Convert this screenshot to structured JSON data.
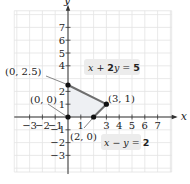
{
  "figure": {
    "origin_px": [
      68,
      117
    ],
    "unit_px": 12.8,
    "grid": {
      "x_min": -4.2,
      "x_max": 8.1,
      "y_min": -4.3,
      "y_max": 8.3,
      "step": 1
    },
    "colors": {
      "grid": "#e3e3e3",
      "axis": "#333333",
      "boundary": "#6e6e6e",
      "region_fill": "#eef0f3",
      "label_bg": "#ececec",
      "point": "#111111"
    }
  },
  "axes": {
    "x_label": "x",
    "y_label": "y",
    "x_ticks": [
      {
        "value": -3,
        "label": "−3"
      },
      {
        "value": -2,
        "label": "−2"
      },
      {
        "value": -1,
        "label": "−1"
      },
      {
        "value": 1,
        "label": "1"
      },
      {
        "value": 3,
        "label": "3"
      },
      {
        "value": 4,
        "label": "4"
      },
      {
        "value": 5,
        "label": "5"
      },
      {
        "value": 6,
        "label": "6"
      },
      {
        "value": 7,
        "label": "7"
      }
    ],
    "y_ticks": [
      {
        "value": 7,
        "label": "7"
      },
      {
        "value": 6,
        "label": "6"
      },
      {
        "value": 5,
        "label": "5"
      },
      {
        "value": 4,
        "label": "4"
      },
      {
        "value": 2,
        "label": "2"
      },
      {
        "value": 1,
        "label": "1"
      },
      {
        "value": -1,
        "label": "−1"
      },
      {
        "value": -2,
        "label": "−2"
      },
      {
        "value": -3,
        "label": "−3"
      }
    ]
  },
  "region": {
    "vertices": [
      [
        0,
        0
      ],
      [
        0,
        2.5
      ],
      [
        3,
        1
      ],
      [
        2,
        0
      ]
    ]
  },
  "points": [
    {
      "x": 0,
      "y": 0,
      "label": "(0, 0)"
    },
    {
      "x": 0,
      "y": 2.5,
      "label": "(0, 2.5)"
    },
    {
      "x": 3,
      "y": 1,
      "label": "(3, 1)"
    },
    {
      "x": 2,
      "y": 0,
      "label": "(2, 0)"
    }
  ],
  "equations": [
    {
      "text_pre": "x + ",
      "coef": "2",
      "text_post": "y = ",
      "rhs": "5",
      "full": "x + 2y = 5"
    },
    {
      "text_pre": "x − y = ",
      "coef": "",
      "text_post": "",
      "rhs": "2",
      "full": "x − y = 2"
    }
  ]
}
